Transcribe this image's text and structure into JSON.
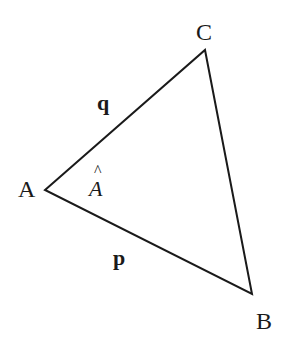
{
  "diagram": {
    "type": "triangle",
    "vertices": [
      {
        "name": "A",
        "x": 45,
        "y": 190,
        "label_x": 18,
        "label_y": 197
      },
      {
        "name": "B",
        "x": 252,
        "y": 294,
        "label_x": 256,
        "label_y": 329
      },
      {
        "name": "C",
        "x": 205,
        "y": 50,
        "label_x": 196,
        "label_y": 40
      }
    ],
    "sides": [
      {
        "name": "q",
        "from": "A",
        "to": "C",
        "label_x": 97,
        "label_y": 110
      },
      {
        "name": "p",
        "from": "A",
        "to": "B",
        "label_x": 113,
        "label_y": 265
      },
      {
        "name": "BC",
        "from": "B",
        "to": "C"
      }
    ],
    "angle_label": {
      "text": "A",
      "hat": "^",
      "x": 89,
      "y": 196
    },
    "colors": {
      "stroke": "#1a1a1a",
      "background": "#ffffff"
    }
  }
}
